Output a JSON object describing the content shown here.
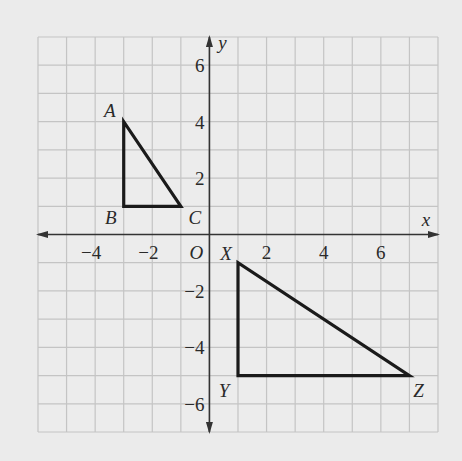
{
  "diagram": {
    "type": "coordinate-plane",
    "x_axis_label": "x",
    "y_axis_label": "y",
    "origin_label": "O",
    "x_range": [
      -6,
      8
    ],
    "y_range": [
      -7,
      7
    ],
    "grid_step": 1,
    "x_ticks": [
      {
        "value": -4,
        "label": "−4"
      },
      {
        "value": -2,
        "label": "−2"
      },
      {
        "value": 2,
        "label": "2"
      },
      {
        "value": 4,
        "label": "4"
      },
      {
        "value": 6,
        "label": "6"
      }
    ],
    "y_ticks": [
      {
        "value": 6,
        "label": "6"
      },
      {
        "value": 4,
        "label": "4"
      },
      {
        "value": 2,
        "label": "2"
      },
      {
        "value": -2,
        "label": "−2"
      },
      {
        "value": -4,
        "label": "−4"
      },
      {
        "value": -6,
        "label": "−6"
      }
    ],
    "triangles": [
      {
        "name": "ABC",
        "vertices": [
          {
            "label": "A",
            "x": -3,
            "y": 4
          },
          {
            "label": "B",
            "x": -3,
            "y": 1
          },
          {
            "label": "C",
            "x": -1,
            "y": 1
          }
        ]
      },
      {
        "name": "XYZ",
        "vertices": [
          {
            "label": "X",
            "x": 1,
            "y": -1
          },
          {
            "label": "Y",
            "x": 1,
            "y": -5
          },
          {
            "label": "Z",
            "x": 7,
            "y": -5
          }
        ]
      }
    ],
    "colors": {
      "background": "#ebebeb",
      "grid": "#c4c4c4",
      "axis": "#333333",
      "shape": "#1a1a1a"
    }
  }
}
